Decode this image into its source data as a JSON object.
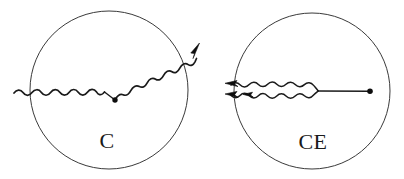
{
  "figure": {
    "name": "feynman-diagram-pair",
    "background_color": "#ffffff",
    "width": 404,
    "height": 179,
    "stroke_color": "#1a1a1a",
    "circle_stroke_color": "#3a3a3a"
  },
  "panels": [
    {
      "id": "panel-c",
      "label": "C",
      "label_x": 107,
      "label_y": 148,
      "circle": {
        "cx": 109,
        "cy": 90,
        "r": 79
      },
      "description": "Compton-like vertex: incoming wavy photon line from left meets a vertex dot, outgoing wavy photon line exits upper right through the circle boundary with an arrowhead",
      "vertex_dot": {
        "cx": 115,
        "cy": 100,
        "r": 2.6
      },
      "arrow_tip": {
        "x": 199,
        "y": 43
      },
      "incoming_wave": {
        "start_x": 14,
        "start_y": 93,
        "end_x": 104,
        "end_y": 92,
        "amplitude": 4,
        "cycles": 7
      },
      "outgoing_wave": {
        "start_x": 115,
        "start_y": 100,
        "end_x": 196,
        "end_y": 45,
        "amplitude": 4.5,
        "cycles": 6
      }
    },
    {
      "id": "panel-ce",
      "label": "CE",
      "label_x": 313,
      "label_y": 149,
      "circle": {
        "cx": 312,
        "cy": 91,
        "r": 78
      },
      "description": "Compton-exchange: two nearly parallel wavy photon lines with leftward arrowheads merge into a lens shape and continue as a single straight line to a vertex dot on the right",
      "vertex_dot": {
        "cx": 370,
        "cy": 91,
        "r": 2.8
      },
      "arrow_tips": [
        {
          "x": 226,
          "y": 84
        },
        {
          "x": 226,
          "y": 94
        }
      ],
      "merge_x": 318,
      "straight_end_x": 369,
      "upper_wave": {
        "start_x": 232,
        "start_y": 85,
        "end_x": 318,
        "end_y": 91,
        "amplitude": 3.5,
        "cycles": 7
      },
      "lower_wave": {
        "start_x": 232,
        "start_y": 95,
        "end_x": 318,
        "end_y": 91,
        "amplitude": 3.5,
        "cycles": 7
      }
    }
  ]
}
